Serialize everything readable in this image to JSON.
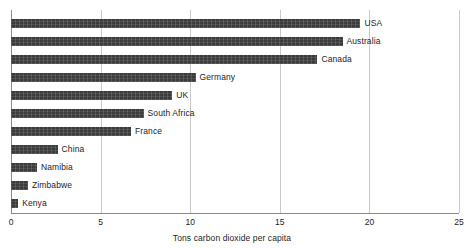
{
  "chart_data": {
    "type": "bar",
    "orientation": "horizontal",
    "title": "",
    "subtitle": "",
    "xlabel": "Tons carbon dioxide per capita",
    "ylabel": "",
    "xlim": [
      0,
      25
    ],
    "xticks": [
      0,
      5,
      10,
      15,
      20,
      25
    ],
    "xticklabels": [
      "0",
      "5",
      "10",
      "15",
      "20",
      "25"
    ],
    "grid": "vertical",
    "legend": "none",
    "bar_color": "#3b3b3b",
    "categories": [
      "USA",
      "Australia",
      "Canada",
      "Germany",
      "UK",
      "South Africa",
      "France",
      "China",
      "Namibia",
      "Zimbabwe",
      "Kenya"
    ],
    "values": [
      19.5,
      18.5,
      17.1,
      10.3,
      9.0,
      7.4,
      6.7,
      2.6,
      1.45,
      0.95,
      0.4
    ],
    "points": [
      {
        "label": "USA",
        "value": 19.5
      },
      {
        "label": "Australia",
        "value": 18.5
      },
      {
        "label": "Canada",
        "value": 17.1
      },
      {
        "label": "Germany",
        "value": 10.3
      },
      {
        "label": "UK",
        "value": 9.0
      },
      {
        "label": "South Africa",
        "value": 7.4
      },
      {
        "label": "France",
        "value": 6.7
      },
      {
        "label": "China",
        "value": 2.6
      },
      {
        "label": "Namibia",
        "value": 1.45
      },
      {
        "label": "Zimbabwe",
        "value": 0.95
      },
      {
        "label": "Kenya",
        "value": 0.4
      }
    ]
  }
}
